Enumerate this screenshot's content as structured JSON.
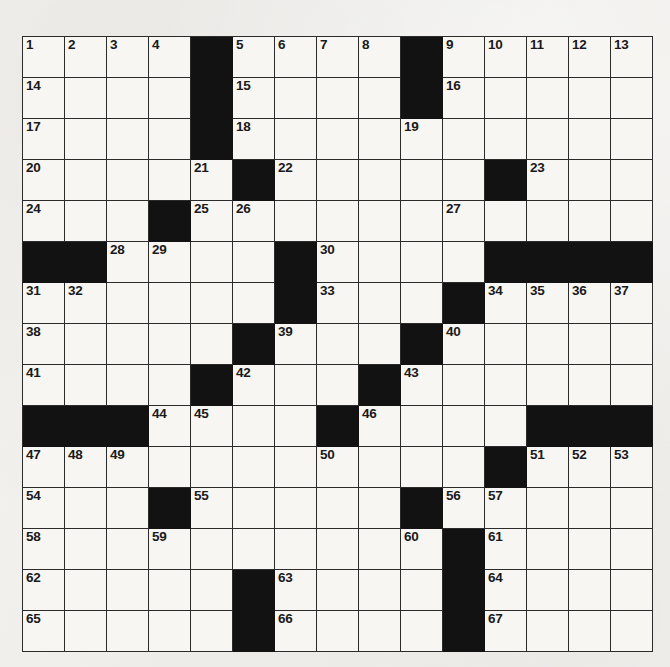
{
  "puzzle": {
    "type": "crossword-grid",
    "title": "Crossword Puzzle Grid",
    "rows": 15,
    "columns": 15,
    "cell_size_px": 42,
    "colors": {
      "paper": "#f2f1ee",
      "cell_fill": "#f7f6f3",
      "block_fill": "#121212",
      "grid_line": "#2b2b2b",
      "number_text": "#1a1a1a"
    },
    "highest_clue_number": 67,
    "grid": [
      [
        {
          "n": "1"
        },
        {
          "n": "2"
        },
        {
          "n": "3"
        },
        {
          "n": "4"
        },
        {
          "b": true
        },
        {
          "n": "5"
        },
        {
          "n": "6"
        },
        {
          "n": "7"
        },
        {
          "n": "8"
        },
        {
          "b": true
        },
        {
          "n": "9"
        },
        {
          "n": "10"
        },
        {
          "n": "11"
        },
        {
          "n": "12"
        },
        {
          "n": "13"
        }
      ],
      [
        {
          "n": "14"
        },
        {},
        {},
        {},
        {
          "b": true
        },
        {
          "n": "15"
        },
        {},
        {},
        {},
        {
          "b": true
        },
        {
          "n": "16"
        },
        {},
        {},
        {},
        {}
      ],
      [
        {
          "n": "17"
        },
        {},
        {},
        {},
        {
          "b": true
        },
        {
          "n": "18"
        },
        {},
        {},
        {},
        {
          "n": "19"
        },
        {},
        {},
        {},
        {},
        {}
      ],
      [
        {
          "n": "20"
        },
        {},
        {},
        {},
        {
          "n": "21"
        },
        {
          "b": true
        },
        {
          "n": "22"
        },
        {},
        {},
        {},
        {},
        {
          "b": true
        },
        {
          "n": "23"
        },
        {},
        {}
      ],
      [
        {
          "n": "24"
        },
        {},
        {},
        {
          "b": true
        },
        {
          "n": "25"
        },
        {
          "n": "26"
        },
        {},
        {},
        {},
        {},
        {
          "n": "27"
        },
        {},
        {},
        {},
        {}
      ],
      [
        {
          "b": true
        },
        {
          "b": true
        },
        {
          "n": "28"
        },
        {
          "n": "29"
        },
        {},
        {},
        {
          "b": true
        },
        {
          "n": "30"
        },
        {},
        {},
        {},
        {
          "b": true
        },
        {
          "b": true
        },
        {
          "b": true
        },
        {
          "b": true
        }
      ],
      [
        {
          "n": "31"
        },
        {
          "n": "32"
        },
        {},
        {},
        {},
        {},
        {
          "b": true
        },
        {
          "n": "33"
        },
        {},
        {},
        {
          "b": true
        },
        {
          "n": "34"
        },
        {
          "n": "35"
        },
        {
          "n": "36"
        },
        {
          "n": "37"
        }
      ],
      [
        {
          "n": "38"
        },
        {},
        {},
        {},
        {},
        {
          "b": true
        },
        {
          "n": "39"
        },
        {},
        {},
        {
          "b": true
        },
        {
          "n": "40"
        },
        {},
        {},
        {},
        {}
      ],
      [
        {
          "n": "41"
        },
        {},
        {},
        {},
        {
          "b": true
        },
        {
          "n": "42"
        },
        {},
        {},
        {
          "b": true
        },
        {
          "n": "43"
        },
        {},
        {},
        {},
        {},
        {}
      ],
      [
        {
          "b": true
        },
        {
          "b": true
        },
        {
          "b": true
        },
        {
          "n": "44"
        },
        {
          "n": "45"
        },
        {},
        {},
        {
          "b": true
        },
        {
          "n": "46"
        },
        {},
        {},
        {},
        {
          "b": true
        },
        {
          "b": true
        },
        {
          "b": true
        }
      ],
      [
        {
          "n": "47"
        },
        {
          "n": "48"
        },
        {
          "n": "49"
        },
        {},
        {},
        {},
        {},
        {
          "n": "50"
        },
        {},
        {},
        {},
        {
          "b": true
        },
        {
          "n": "51"
        },
        {
          "n": "52"
        },
        {
          "n": "53"
        }
      ],
      [
        {
          "n": "54"
        },
        {},
        {},
        {
          "b": true
        },
        {
          "n": "55"
        },
        {},
        {},
        {},
        {},
        {
          "b": true
        },
        {
          "n": "56"
        },
        {
          "n": "57"
        },
        {},
        {},
        {}
      ],
      [
        {
          "n": "58"
        },
        {},
        {},
        {
          "n": "59"
        },
        {},
        {},
        {},
        {},
        {},
        {
          "n": "60"
        },
        {
          "b": true
        },
        {
          "n": "61"
        },
        {},
        {},
        {}
      ],
      [
        {
          "n": "62"
        },
        {},
        {},
        {},
        {},
        {
          "b": true
        },
        {
          "n": "63"
        },
        {},
        {},
        {},
        {
          "b": true
        },
        {
          "n": "64"
        },
        {},
        {},
        {}
      ],
      [
        {
          "n": "65"
        },
        {},
        {},
        {},
        {},
        {
          "b": true
        },
        {
          "n": "66"
        },
        {},
        {},
        {},
        {
          "b": true
        },
        {
          "n": "67"
        },
        {},
        {},
        {}
      ]
    ]
  }
}
